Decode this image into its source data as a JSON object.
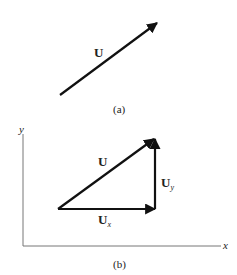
{
  "figure_a": {
    "vector_label": "U",
    "caption": "(a)"
  },
  "figure_b": {
    "axis_y_label": "y",
    "axis_x_label": "x",
    "vector_label": "U",
    "component_y_label": "U",
    "component_y_sub": "y",
    "component_x_label": "U",
    "component_x_sub": "x",
    "caption": "(b)"
  },
  "colors": {
    "stroke": "#111111",
    "axis": "#666666",
    "text": "#222222"
  }
}
